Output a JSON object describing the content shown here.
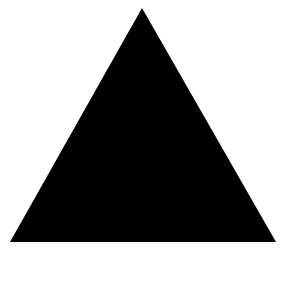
{
  "canvas": {
    "width": 292,
    "height": 297,
    "background": "#ffffff"
  },
  "shape": {
    "type": "triangle",
    "points": "142,8 10,242 276,242",
    "fill": "#000000"
  }
}
